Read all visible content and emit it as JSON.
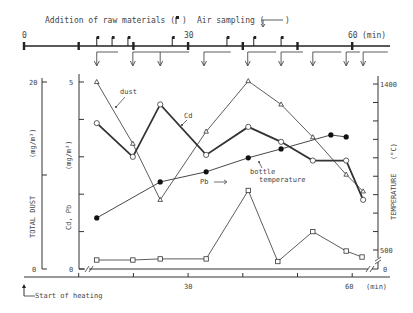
{
  "timeline": {
    "legend_addition": "Addition of raw materials (",
    "legend_addition_close": ")",
    "legend_sampling": "Air sampling (",
    "legend_sampling_close": ")",
    "tick_labels": [
      {
        "t": 0,
        "label": "0"
      },
      {
        "t": 30,
        "label": "30"
      },
      {
        "t": 60,
        "label": "60"
      }
    ],
    "unit_label": "(min)",
    "major_ticks_min": [
      0,
      10,
      20,
      30,
      40,
      50,
      60
    ],
    "raw_material_additions_min": [
      13.3,
      16.1,
      19.0,
      27.1,
      37.1,
      42.0,
      47.0
    ],
    "air_sampling_intervals_min": [
      [
        13.3,
        17.2
      ],
      [
        19.9,
        24.9
      ],
      [
        24.9,
        30.2
      ],
      [
        32.9,
        37.8
      ],
      [
        40.9,
        46.1
      ],
      [
        47.0,
        51.0
      ],
      [
        52.8,
        58.0
      ],
      [
        58.9,
        61.4
      ],
      [
        62.0,
        66.5
      ]
    ]
  },
  "axes": {
    "left_outer_label": "TOTAL DUST",
    "left_outer_unit": "(mg/m³)",
    "left_outer_ticks": [
      {
        "v": 0,
        "label": "0"
      },
      {
        "v": 10,
        "label": ""
      },
      {
        "v": 20,
        "label": "20"
      }
    ],
    "left_inner_label": "Cd, Pb",
    "left_inner_unit": "(mg/m³)",
    "left_inner_ticks": [
      {
        "v": 0,
        "label": "0"
      },
      {
        "v": 1,
        "label": ""
      },
      {
        "v": 2,
        "label": ""
      },
      {
        "v": 3,
        "label": ""
      },
      {
        "v": 4,
        "label": ""
      },
      {
        "v": 5,
        "label": "5"
      }
    ],
    "right_label": "TEMPERATURE",
    "right_unit": "(°C)",
    "right_ticks": [
      {
        "v": 0,
        "label": "0"
      },
      {
        "v": 500,
        "label": "500"
      },
      {
        "v": 600,
        "label": ""
      },
      {
        "v": 700,
        "label": ""
      },
      {
        "v": 800,
        "label": ""
      },
      {
        "v": 900,
        "label": ""
      },
      {
        "v": 1000,
        "label": ""
      },
      {
        "v": 1100,
        "label": ""
      },
      {
        "v": 1200,
        "label": ""
      },
      {
        "v": 1300,
        "label": ""
      },
      {
        "v": 1400,
        "label": "1400"
      }
    ],
    "x_tick_labels": [
      {
        "t": 30,
        "label": "30"
      },
      {
        "t": 60,
        "label": "60"
      }
    ],
    "x_unit": "(min)",
    "x_major_ticks": [
      10,
      20,
      30,
      40,
      50,
      60
    ]
  },
  "annotations": {
    "dust": "dust",
    "cd": "Cd",
    "pb": "Pb",
    "bottle1": "bottle",
    "bottle2": "temperature",
    "start": "Start of heating"
  },
  "chart_data": {
    "type": "line",
    "title": "",
    "xlabel": "(min)",
    "x_range": [
      0,
      65
    ],
    "grid": false,
    "legend_position": "inline annotations",
    "series": [
      {
        "name": "dust",
        "axis": "TOTAL DUST (mg/m3)",
        "ylim": [
          0,
          20
        ],
        "marker": "triangle-open",
        "x": [
          13.3,
          19.9,
          24.9,
          33.3,
          41.0,
          47.0,
          52.8,
          58.9,
          62.0
        ],
        "values": [
          20.0,
          13.4,
          7.4,
          14.7,
          20.1,
          17.6,
          14.1,
          10.1,
          8.3
        ]
      },
      {
        "name": "Cd",
        "axis": "Cd, Pb (mg/m3)",
        "ylim": [
          0,
          5
        ],
        "marker": "circle-open",
        "x": [
          13.3,
          19.9,
          24.9,
          33.3,
          41.0,
          47.0,
          52.8,
          58.9,
          62.0
        ],
        "values": [
          3.9,
          3.0,
          4.4,
          3.05,
          3.8,
          3.4,
          2.9,
          2.9,
          1.85
        ]
      },
      {
        "name": "Pb",
        "axis": "Cd, Pb (mg/m3)",
        "ylim": [
          0,
          5
        ],
        "marker": "square-open",
        "x": [
          13.3,
          19.9,
          24.9,
          33.3,
          41.0,
          46.4,
          52.8,
          58.9,
          61.8
        ],
        "values": [
          0.24,
          0.24,
          0.27,
          0.27,
          2.1,
          0.2,
          1.0,
          0.48,
          0.32
        ]
      },
      {
        "name": "bottle temperature",
        "axis": "TEMPERATURE (°C)",
        "ylim": [
          0,
          1400
        ],
        "marker": "circle-filled",
        "x": [
          13.3,
          24.9,
          33.3,
          41.0,
          47.0,
          56.1,
          58.9
        ],
        "values": [
          674,
          869,
          924,
          1000,
          1048,
          1124,
          1113
        ]
      }
    ]
  }
}
